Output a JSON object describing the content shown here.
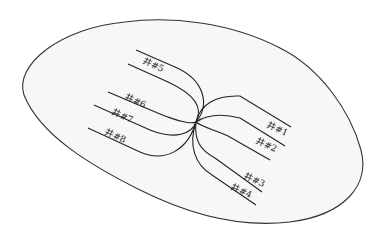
{
  "diagram": {
    "type": "well-layout",
    "colors": {
      "outline_stroke": "#333333",
      "outline_fill": "#f7f7f7",
      "well_stroke": "#222222",
      "label_color": "#222222"
    },
    "wells": [
      {
        "id": "well-1",
        "label": "井#1",
        "side": "right"
      },
      {
        "id": "well-2",
        "label": "井#2",
        "side": "right"
      },
      {
        "id": "well-3",
        "label": "井#3",
        "side": "right"
      },
      {
        "id": "well-4",
        "label": "井#4",
        "side": "right"
      },
      {
        "id": "well-5",
        "label": "井#5",
        "side": "left"
      },
      {
        "id": "well-6",
        "label": "井#6",
        "side": "left"
      },
      {
        "id": "well-7",
        "label": "井#7",
        "side": "left"
      },
      {
        "id": "well-8",
        "label": "井#8",
        "side": "left"
      }
    ]
  }
}
